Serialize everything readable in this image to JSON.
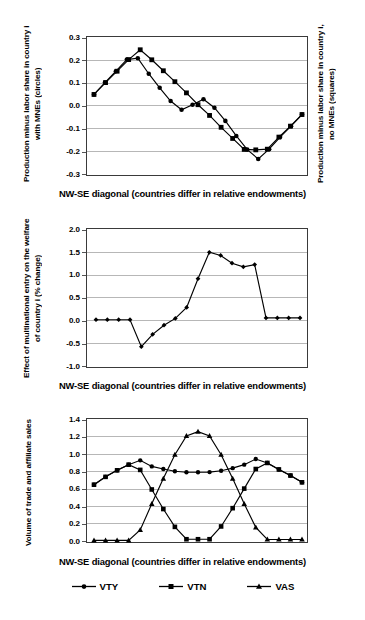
{
  "figure": {
    "x_caption": "NW-SE diagonal  (countries differ in relative endowments)"
  },
  "chart_data": [
    {
      "id": "panel-1",
      "type": "line",
      "title": "",
      "xlabel": "NW-SE diagonal  (countries differ in relative endowments)",
      "ylabel": "Production minus labor share in country i with MNEs (circles)",
      "ylabel_right": "Production minus labor share in country i, no MNEs (squares)",
      "ylim": [
        -0.3,
        0.3
      ],
      "yticks": [
        "0.3",
        "0.2",
        "0.1",
        "0.0",
        "-0.1",
        "-0.2",
        "-0.3"
      ],
      "ytickvals": [
        0.3,
        0.2,
        0.1,
        0.0,
        -0.1,
        -0.2,
        -0.3
      ],
      "grid": true,
      "legend": "none",
      "x": [
        1,
        2,
        3,
        4,
        5,
        6,
        7,
        8,
        9,
        10,
        11,
        12,
        13,
        14,
        15,
        16,
        17,
        18,
        19
      ],
      "series": [
        {
          "name": "Production minus labor share, with MNEs",
          "marker": "circle",
          "values": [
            0.048,
            0.1,
            0.15,
            0.201,
            0.207,
            0.139,
            0.077,
            0.019,
            -0.019,
            0.003,
            0.027,
            -0.01,
            -0.068,
            -0.134,
            -0.194,
            -0.235,
            -0.192,
            -0.139,
            -0.091,
            -0.04
          ]
        },
        {
          "name": "Production minus labor share, no MNEs",
          "marker": "square",
          "values": [
            0.048,
            0.1,
            0.15,
            0.201,
            0.244,
            0.2,
            0.152,
            0.104,
            0.055,
            0.003,
            -0.044,
            -0.096,
            -0.145,
            -0.193,
            -0.195,
            -0.192,
            -0.139,
            -0.091,
            -0.04
          ]
        }
      ]
    },
    {
      "id": "panel-2",
      "type": "line",
      "title": "",
      "xlabel": "NW-SE diagonal  (countries differ in relative endowments)",
      "ylabel": "Effect of multinational entry on the welfare of country i (% change)",
      "ylim": [
        -1.0,
        2.0
      ],
      "yticks": [
        "2.0",
        "1.5",
        "1.0",
        "0.5",
        "0.0",
        "-0.5",
        "-1.0"
      ],
      "ytickvals": [
        2.0,
        1.5,
        1.0,
        0.5,
        0.0,
        -0.5,
        -1.0
      ],
      "grid": true,
      "legend": "none",
      "x": [
        1,
        2,
        3,
        4,
        5,
        6,
        7,
        8,
        9,
        10,
        11,
        12,
        13,
        14,
        15,
        16,
        17,
        18,
        19,
        20,
        21
      ],
      "series": [
        {
          "name": "Welfare effect of multinational entry",
          "marker": "diamond",
          "values": [
            0.01,
            0.01,
            0.01,
            0.01,
            -0.58,
            -0.31,
            -0.11,
            0.04,
            0.28,
            0.91,
            1.49,
            1.42,
            1.25,
            1.17,
            1.22,
            0.05,
            0.05,
            0.05,
            0.05
          ]
        }
      ]
    },
    {
      "id": "panel-3",
      "type": "line",
      "title": "",
      "xlabel": "NW-SE diagonal  (countries differ in relative endowments)",
      "ylabel": "Volume of trade and affiliate sales",
      "ylim": [
        0.0,
        1.4
      ],
      "yticks": [
        "1.4",
        "1.2",
        "1.0",
        "0.8",
        "0.6",
        "0.4",
        "0.2",
        "0.0"
      ],
      "ytickvals": [
        1.4,
        1.2,
        1.0,
        0.8,
        0.6,
        0.4,
        0.2,
        0.0
      ],
      "grid": true,
      "legend": "bottom",
      "x": [
        1,
        2,
        3,
        4,
        5,
        6,
        7,
        8,
        9,
        10,
        11,
        12,
        13,
        14,
        15,
        16,
        17,
        18,
        19,
        20,
        21
      ],
      "series": [
        {
          "name": "VTY",
          "marker": "circle",
          "values": [
            0.645,
            0.735,
            0.81,
            0.875,
            0.925,
            0.855,
            0.825,
            0.8,
            0.788,
            0.788,
            0.79,
            0.805,
            0.835,
            0.875,
            0.94,
            0.895,
            0.82,
            0.75,
            0.672
          ]
        },
        {
          "name": "VTN",
          "marker": "square",
          "values": [
            0.645,
            0.735,
            0.81,
            0.875,
            0.815,
            0.59,
            0.365,
            0.16,
            0.018,
            0.018,
            0.018,
            0.165,
            0.375,
            0.6,
            0.825,
            0.895,
            0.82,
            0.75,
            0.672
          ]
        },
        {
          "name": "VAS",
          "marker": "triangle",
          "values": [
            0.005,
            0.005,
            0.005,
            0.005,
            0.125,
            0.425,
            0.715,
            0.99,
            1.205,
            1.255,
            1.205,
            0.99,
            0.715,
            0.425,
            0.155,
            0.015,
            0.015,
            0.015,
            0.015
          ]
        }
      ],
      "legend_entries": [
        {
          "label": "VTY",
          "marker": "circle"
        },
        {
          "label": "VTN",
          "marker": "square"
        },
        {
          "label": "VAS",
          "marker": "triangle"
        }
      ]
    }
  ]
}
